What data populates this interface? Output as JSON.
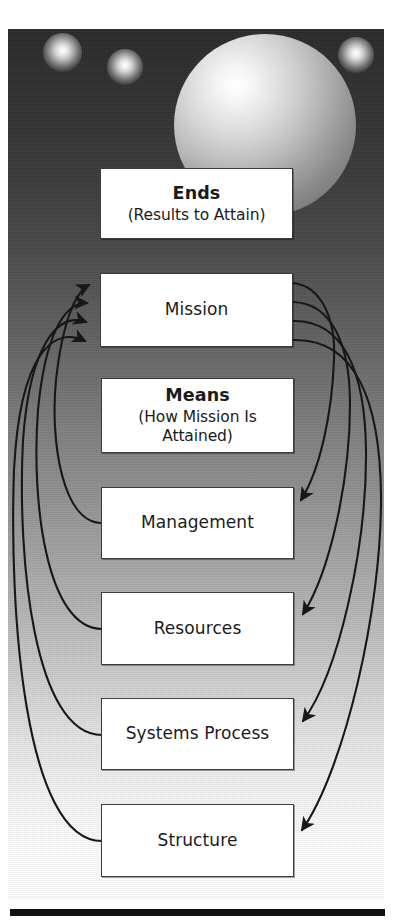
{
  "diagram": {
    "background": {
      "style": "dark-to-light vertical gradient with spheres",
      "gradient_top_color": "#2b2b2b",
      "gradient_bottom_color": "#ffffff"
    },
    "nodes": [
      {
        "id": "ends",
        "title": "Ends",
        "subtitle": "(Results to Attain)",
        "bold_title": true
      },
      {
        "id": "mission",
        "title": "Mission",
        "subtitle": "",
        "bold_title": false
      },
      {
        "id": "means",
        "title": "Means",
        "subtitle": "(How Mission Is Attained)",
        "bold_title": true
      },
      {
        "id": "management",
        "title": "Management",
        "subtitle": "",
        "bold_title": false
      },
      {
        "id": "resources",
        "title": "Resources",
        "subtitle": "",
        "bold_title": false
      },
      {
        "id": "systems-process",
        "title": "Systems Process",
        "subtitle": "",
        "bold_title": false
      },
      {
        "id": "structure",
        "title": "Structure",
        "subtitle": "",
        "bold_title": false
      }
    ],
    "connections": [
      {
        "from": "management",
        "to": "mission",
        "side": "left",
        "arrow_at": "mission"
      },
      {
        "from": "resources",
        "to": "mission",
        "side": "left",
        "arrow_at": "mission"
      },
      {
        "from": "systems-process",
        "to": "mission",
        "side": "left",
        "arrow_at": "mission"
      },
      {
        "from": "structure",
        "to": "mission",
        "side": "left",
        "arrow_at": "mission"
      },
      {
        "from": "mission",
        "to": "management",
        "side": "right",
        "arrow_at": "management"
      },
      {
        "from": "mission",
        "to": "resources",
        "side": "right",
        "arrow_at": "resources"
      },
      {
        "from": "mission",
        "to": "systems-process",
        "side": "right",
        "arrow_at": "systems-process"
      },
      {
        "from": "mission",
        "to": "structure",
        "side": "right",
        "arrow_at": "structure"
      }
    ],
    "decor": {
      "large_sphere": "large-sphere",
      "small_spheres": [
        "small-sphere-1",
        "small-sphere-2",
        "small-sphere-3"
      ],
      "bottom_rule": "horizontal-rule"
    }
  }
}
